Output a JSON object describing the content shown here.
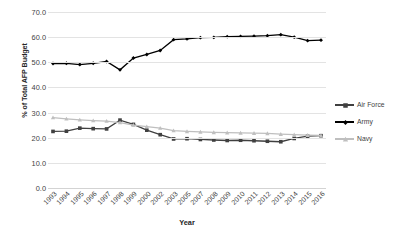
{
  "chart_data": {
    "type": "line",
    "title": "",
    "xlabel": "Year",
    "ylabel": "% of Total AFP Budget",
    "ylim": [
      0.0,
      70.0
    ],
    "ytick_step": 10.0,
    "yticks": [
      "0.0",
      "10.0",
      "20.0",
      "30.0",
      "40.0",
      "50.0",
      "60.0",
      "70.0"
    ],
    "grid": true,
    "legend_position": "right",
    "categories": [
      "1993",
      "1994",
      "1995",
      "1996",
      "1997",
      "1998",
      "1999",
      "2000",
      "2002",
      "2003",
      "2005",
      "2007",
      "2008",
      "2009",
      "2010",
      "2011",
      "2012",
      "2013",
      "2014",
      "2015",
      "2016"
    ],
    "series": [
      {
        "name": "Air Force",
        "color": "#404040",
        "marker": "square",
        "values": [
          22.5,
          22.6,
          23.8,
          23.6,
          23.5,
          27.0,
          25.3,
          23.0,
          21.2,
          19.5,
          19.6,
          19.3,
          19.1,
          18.9,
          19.0,
          18.8,
          18.6,
          18.4,
          19.7,
          20.6,
          20.8
        ]
      },
      {
        "name": "Army",
        "color": "#000000",
        "marker": "diamond",
        "values": [
          49.5,
          49.6,
          49.1,
          49.6,
          50.3,
          47.0,
          51.7,
          53.1,
          54.7,
          59.0,
          59.3,
          59.8,
          59.9,
          60.2,
          60.3,
          60.4,
          60.6,
          61.0,
          60.0,
          58.6,
          58.8
        ]
      },
      {
        "name": "Navy",
        "color": "#bfbfbf",
        "marker": "triangle",
        "values": [
          28.0,
          27.5,
          27.1,
          26.8,
          26.6,
          26.0,
          25.0,
          24.4,
          23.8,
          22.8,
          22.5,
          22.3,
          22.1,
          22.0,
          21.9,
          21.8,
          21.7,
          21.4,
          21.2,
          21.0,
          20.9
        ]
      }
    ]
  },
  "legend": {
    "items": [
      {
        "label": "Air Force"
      },
      {
        "label": "Army"
      },
      {
        "label": "Navy"
      }
    ]
  }
}
